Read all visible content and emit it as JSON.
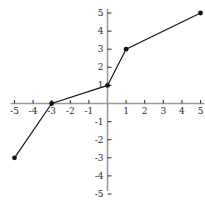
{
  "chart_data": {
    "type": "line",
    "title": "",
    "subtitle": "",
    "xlabel": "",
    "ylabel": "",
    "xlim": [
      -5,
      5
    ],
    "ylim": [
      -5,
      5
    ],
    "grid": false,
    "legend": null,
    "legend_position": "none",
    "axis_style": "centered-cartesian",
    "x_ticks": [
      -5,
      -4,
      -3,
      -2,
      -1,
      1,
      2,
      3,
      4,
      5
    ],
    "y_ticks": [
      5,
      4,
      3,
      2,
      1,
      -1,
      -2,
      -3,
      -4,
      -5
    ],
    "x_tick_labels": [
      "-5",
      "-4",
      "-3",
      "-2",
      "-1",
      "1",
      "2",
      "3",
      "4",
      "5"
    ],
    "y_tick_labels": [
      "5",
      "4",
      "3",
      "2",
      "1",
      "-1",
      "-2",
      "-3",
      "-4",
      "-5"
    ],
    "series": [
      {
        "name": "piecewise-linear",
        "marker": "filled-circle",
        "line_color": "#1a1a1a",
        "marker_color": "#111111",
        "points": [
          {
            "x": -5,
            "y": -3
          },
          {
            "x": -3,
            "y": 0
          },
          {
            "x": 0,
            "y": 1
          },
          {
            "x": 1,
            "y": 3
          },
          {
            "x": 5,
            "y": 5
          }
        ],
        "x": [
          -5,
          -3,
          0,
          1,
          5
        ],
        "values": [
          -3,
          0,
          1,
          3,
          5
        ]
      }
    ],
    "colors": {
      "axis": "#9a9a9a",
      "tick": "#3a3a3a",
      "label": "#2b2b2b",
      "line": "#1a1a1a",
      "marker": "#111111",
      "background": "#ffffff"
    }
  }
}
